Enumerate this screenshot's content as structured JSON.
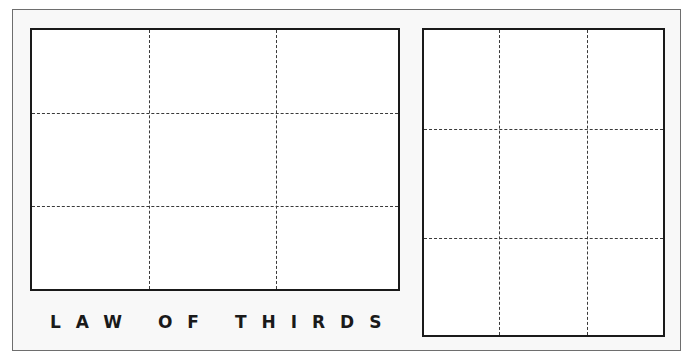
{
  "diagram": {
    "title": "LAW OF THIRDS",
    "panels": [
      {
        "name": "landscape-frame",
        "orientation": "landscape",
        "rows": 3,
        "cols": 3
      },
      {
        "name": "portrait-frame",
        "orientation": "portrait",
        "rows": 3,
        "cols": 3
      }
    ],
    "colors": {
      "frame": "#1a1a1a",
      "grid": "#3a3a3a",
      "background": "#f8f8f8",
      "panel": "#ffffff"
    }
  }
}
